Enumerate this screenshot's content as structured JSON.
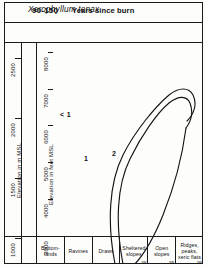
{
  "figure": {
    "title": "Xerophyllum tenax",
    "burn_value": "90-150",
    "burn_label": "Years since burn"
  },
  "axes": {
    "left_metric": {
      "caption": "Elevation in m MSL",
      "unit": "m",
      "ticks": [
        2500,
        2000,
        1500,
        1000
      ]
    },
    "left_feet": {
      "caption": "Elevation in feet MSL",
      "unit": "ft",
      "ticks": [
        8000,
        7000,
        6000,
        5000,
        4000,
        3000
      ]
    },
    "bottom": {
      "categories": [
        {
          "label": "Bottom-\nlands",
          "corner": ""
        },
        {
          "label": "Ravines",
          "corner": ""
        },
        {
          "label": "Draws",
          "corner": ""
        },
        {
          "label": "Sheltered\nslopes",
          "corner": "sw"
        },
        {
          "label": "Open slopes",
          "corner": "sw"
        },
        {
          "label": "Ridges, peaks,\nxeric flats",
          "corner": "sw"
        }
      ]
    }
  },
  "chart_data": {
    "type": "line",
    "title": "Xerophyllum tenax",
    "subtitle": "90-150 Years since burn",
    "xlabel": "Topographic position",
    "ylabel": "Elevation in m MSL",
    "ylabel_secondary": "Elevation in feet MSL",
    "ylim_m": [
      900,
      2600
    ],
    "ylim_ft": [
      2900,
      8500
    ],
    "ytick_m": [
      1000,
      1500,
      2000,
      2500
    ],
    "ytick_ft": [
      3000,
      4000,
      5000,
      6000,
      7000,
      8000
    ],
    "categories": [
      "Bottom-lands",
      "Ravines",
      "Draws",
      "Sheltered slopes",
      "Open slopes",
      "Ridges, peaks, xeric flats"
    ],
    "grid": false,
    "legend": "none",
    "contours": [
      {
        "name": "< 1",
        "level": "<1",
        "label_position": {
          "x": 90,
          "y": 118
        },
        "description": "outer region label, open area left of contour 1"
      },
      {
        "name": "1",
        "level": 1,
        "label_position": {
          "x": 113,
          "y": 159
        },
        "description": "outer closed contour spanning sheltered slopes to ridges, peaking near 2150 m"
      },
      {
        "name": "2",
        "level": 2,
        "label_position": {
          "x": 140,
          "y": 155
        },
        "description": "inner closed contour core of abundance on open slopes, peaking near 2150 m"
      }
    ],
    "annotations": [
      "< 1",
      "1",
      "2"
    ]
  },
  "colors": {
    "ink": "#1a1a1a",
    "paper": "#fdfdfc",
    "contour": "#151515"
  }
}
